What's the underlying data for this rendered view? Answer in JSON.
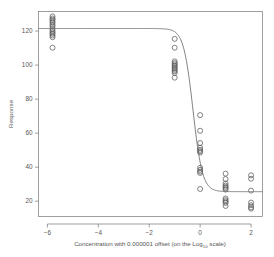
{
  "chart_data": {
    "type": "scatter",
    "title": "",
    "xlabel": "Concentration with 0.000001 offset (on the Log10 scale)",
    "xlabel_prefix": "Concentration with 0.000001 offset (on the Log",
    "xlabel_sub": "10",
    "xlabel_suffix": " scale)",
    "ylabel": "Response",
    "xlim": [
      -6.35,
      2.45
    ],
    "ylim": [
      11.0,
      131.5
    ],
    "xticks": [
      -6,
      -4,
      -2,
      0,
      2
    ],
    "xticklabels": [
      "−6",
      "−4",
      "−2",
      "0",
      "2"
    ],
    "yticks": [
      20,
      40,
      60,
      80,
      100,
      120
    ],
    "yticklabels": [
      "20",
      "40",
      "60",
      "80",
      "100",
      "120"
    ],
    "grid": false,
    "legend": false,
    "marker": "open-circle",
    "marker_color": "#5a5a5a",
    "curve_color": "#6a6a6a",
    "series": [
      {
        "name": "Response observations",
        "points": [
          [
            -5.8,
            128.6
          ],
          [
            -5.8,
            127.4
          ],
          [
            -5.8,
            126.6
          ],
          [
            -5.8,
            125.6
          ],
          [
            -5.8,
            124.8
          ],
          [
            -5.8,
            123.6
          ],
          [
            -5.8,
            122.6
          ],
          [
            -5.8,
            121.2
          ],
          [
            -5.8,
            120.2
          ],
          [
            -5.8,
            119.2
          ],
          [
            -5.8,
            118.4
          ],
          [
            -5.8,
            117.4
          ],
          [
            -5.8,
            116.4
          ],
          [
            -5.8,
            110.2
          ],
          [
            -1.0,
            115.4
          ],
          [
            -1.0,
            110.2
          ],
          [
            -1.0,
            102.2
          ],
          [
            -1.0,
            101.2
          ],
          [
            -1.0,
            100.4
          ],
          [
            -1.0,
            99.6
          ],
          [
            -1.0,
            98.8
          ],
          [
            -1.0,
            98.0
          ],
          [
            -1.0,
            97.2
          ],
          [
            -1.0,
            96.4
          ],
          [
            -1.0,
            95.4
          ],
          [
            -1.0,
            92.6
          ],
          [
            0.0,
            70.6
          ],
          [
            0.0,
            61.4
          ],
          [
            0.0,
            54.2
          ],
          [
            0.0,
            51.4
          ],
          [
            0.0,
            50.2
          ],
          [
            0.0,
            49.4
          ],
          [
            0.0,
            48.6
          ],
          [
            0.0,
            39.6
          ],
          [
            0.0,
            38.4
          ],
          [
            0.0,
            37.4
          ],
          [
            0.0,
            36.6
          ],
          [
            0.0,
            27.2
          ],
          [
            1.0,
            36.2
          ],
          [
            1.0,
            33.0
          ],
          [
            1.0,
            30.4
          ],
          [
            1.0,
            29.2
          ],
          [
            1.0,
            28.4
          ],
          [
            1.0,
            27.6
          ],
          [
            1.0,
            26.8
          ],
          [
            1.0,
            21.6
          ],
          [
            1.0,
            20.6
          ],
          [
            1.0,
            19.8
          ],
          [
            1.0,
            19.0
          ],
          [
            1.0,
            17.2
          ],
          [
            2.0,
            35.2
          ],
          [
            2.0,
            33.2
          ],
          [
            2.0,
            26.2
          ],
          [
            2.0,
            19.2
          ],
          [
            2.0,
            17.6
          ],
          [
            2.0,
            16.4
          ],
          [
            2.0,
            15.6
          ]
        ]
      }
    ],
    "fit": {
      "name": "4-parameter logistic fit",
      "model": "four-parameter-logistic",
      "top": 121.5,
      "bottom": 25.6,
      "logEC50": -0.28,
      "hill_slope": 2.35
    }
  }
}
